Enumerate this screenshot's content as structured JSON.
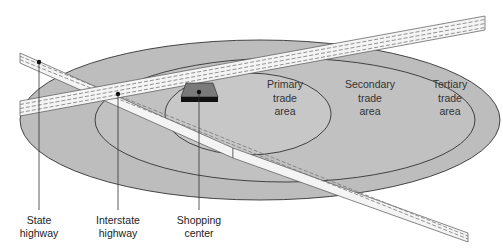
{
  "diagram": {
    "type": "trade-area-concentric-ellipses",
    "colors": {
      "background": "#ffffff",
      "tertiary_fill": "#bdbdbd",
      "secondary_fill": "#c2c2c2",
      "primary_fill": "#c8c8c8",
      "outline": "#333333",
      "road_fill": "#f4f4f4",
      "road_dash": "#777777",
      "store_top": "#7a7a7a",
      "store_front": "#111111",
      "leader_line": "#333333"
    },
    "areas": {
      "primary": {
        "line1": "Primary",
        "line2": "trade",
        "line3": "area"
      },
      "secondary": {
        "line1": "Secondary",
        "line2": "trade",
        "line3": "area"
      },
      "tertiary": {
        "line1": "Tertiary",
        "line2": "trade",
        "line3": "area"
      }
    },
    "callouts": {
      "state_highway": {
        "line1": "State",
        "line2": "highway"
      },
      "interstate_highway": {
        "line1": "Interstate",
        "line2": "highway"
      },
      "shopping_center": {
        "line1": "Shopping",
        "line2": "center"
      }
    }
  }
}
